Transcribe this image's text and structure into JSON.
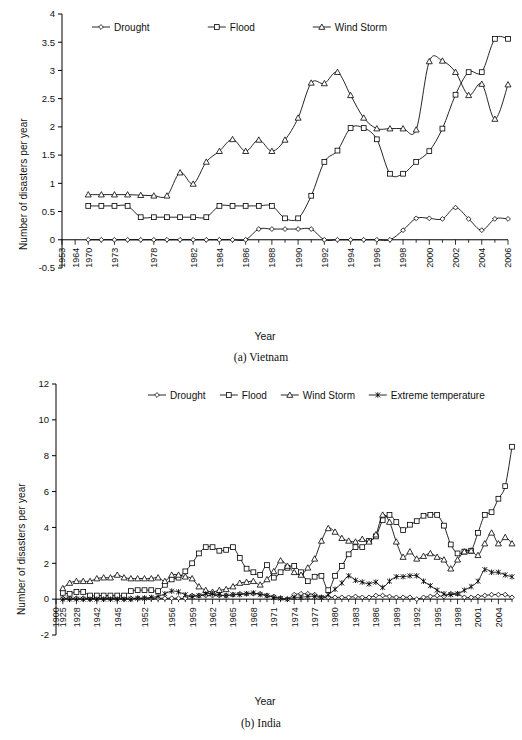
{
  "figure": {
    "panels": [
      {
        "caption": "(a) Vietnam",
        "xlabel": "Year",
        "ylabel": "Number of disasters per year"
      },
      {
        "caption": "(b) India",
        "xlabel": "Year",
        "ylabel": "Number of disasters per year"
      }
    ]
  },
  "chart_data": [
    {
      "type": "line",
      "title": "(a) Vietnam",
      "xlabel": "Year",
      "ylabel": "Number of disasters per year",
      "ylim": [
        -0.5,
        4
      ],
      "yticks": [
        -0.5,
        0,
        0.5,
        1,
        1.5,
        2,
        2.5,
        3,
        3.5,
        4
      ],
      "ytick_labels": [
        "-0.5",
        "0",
        "0.5",
        "1",
        "1.5",
        "2",
        "2.5",
        "3",
        "3.5",
        "4"
      ],
      "grid": false,
      "legend_position": "top-inside",
      "xtick_labels": [
        "1953",
        "1964",
        "1970",
        "1973",
        "1978",
        "1982",
        "1984",
        "1986",
        "1988",
        "1990",
        "1992",
        "1994",
        "1996",
        "1998",
        "2000",
        "2002",
        "2004",
        "2006"
      ],
      "xtick_indices": [
        0,
        1,
        2,
        4,
        7,
        10,
        12,
        14,
        16,
        18,
        20,
        22,
        24,
        26,
        28,
        30,
        32,
        34
      ],
      "x": [
        1953,
        1964,
        1970,
        1971,
        1972,
        1973,
        1976,
        1977,
        1978,
        1980,
        1982,
        1983,
        1984,
        1985,
        1986,
        1987,
        1988,
        1989,
        1990,
        1991,
        1992,
        1993,
        1994,
        1995,
        1996,
        1997,
        1998,
        1999,
        2000,
        2001,
        2002,
        2003,
        2004,
        2005,
        2006
      ],
      "series": [
        {
          "name": "Drought",
          "marker": "diamond",
          "values": [
            null,
            null,
            0,
            0,
            0,
            0,
            0,
            0,
            0,
            0,
            0,
            0,
            0,
            0,
            0,
            0.19,
            0.19,
            0.19,
            0.19,
            0.19,
            0,
            0,
            0,
            0,
            0,
            0,
            0.17,
            0.38,
            0.38,
            0.37,
            0.57,
            0.37,
            0.17,
            0.37,
            0.37
          ]
        },
        {
          "name": "Flood",
          "marker": "square",
          "values": [
            null,
            null,
            0.6,
            0.6,
            0.6,
            0.6,
            0.4,
            0.4,
            0.4,
            0.4,
            0.4,
            0.4,
            0.6,
            0.6,
            0.6,
            0.6,
            0.6,
            0.38,
            0.38,
            0.78,
            1.38,
            1.58,
            1.98,
            1.98,
            1.78,
            1.17,
            1.17,
            1.38,
            1.57,
            1.97,
            2.57,
            2.97,
            2.97,
            3.56,
            3.56
          ]
        },
        {
          "name": "Wind Storm",
          "marker": "triangle",
          "values": [
            null,
            null,
            0.8,
            0.8,
            0.8,
            0.8,
            0.79,
            0.78,
            0.78,
            1.19,
            0.99,
            1.38,
            1.57,
            1.78,
            1.57,
            1.77,
            1.57,
            1.77,
            2.16,
            2.78,
            2.77,
            2.97,
            2.56,
            2.16,
            1.97,
            1.97,
            1.97,
            1.95,
            3.16,
            3.17,
            2.97,
            2.56,
            2.76,
            2.14,
            2.75
          ]
        }
      ]
    },
    {
      "type": "line",
      "title": "(b) India",
      "xlabel": "Year",
      "ylabel": "Number of disasters per year",
      "ylim": [
        -2,
        12
      ],
      "yticks": [
        -2,
        0,
        2,
        4,
        6,
        8,
        10,
        12
      ],
      "ytick_labels": [
        "-2",
        "0",
        "2",
        "4",
        "6",
        "8",
        "10",
        "12"
      ],
      "grid": false,
      "legend_position": "top-inside",
      "xtick_labels": [
        "1900",
        "1925",
        "1928",
        "1942",
        "1945",
        "1952",
        "1956",
        "1959",
        "1962",
        "1965",
        "1968",
        "1971",
        "1974",
        "1977",
        "1980",
        "1983",
        "1986",
        "1989",
        "1992",
        "1995",
        "1998",
        "2001",
        "2004"
      ],
      "xtick_indices": [
        0,
        1,
        3,
        6,
        9,
        13,
        17,
        20,
        23,
        26,
        29,
        32,
        35,
        38,
        41,
        44,
        47,
        50,
        53,
        56,
        59,
        62,
        65
      ],
      "x": [
        1900,
        1925,
        1926,
        1928,
        1930,
        1935,
        1942,
        1943,
        1944,
        1945,
        1946,
        1950,
        1951,
        1952,
        1953,
        1954,
        1955,
        1956,
        1957,
        1958,
        1959,
        1960,
        1961,
        1962,
        1963,
        1964,
        1965,
        1966,
        1967,
        1968,
        1969,
        1970,
        1971,
        1972,
        1973,
        1974,
        1975,
        1976,
        1977,
        1978,
        1979,
        1980,
        1981,
        1982,
        1983,
        1984,
        1985,
        1986,
        1987,
        1988,
        1989,
        1990,
        1991,
        1992,
        1993,
        1994,
        1995,
        1996,
        1997,
        1998,
        1999,
        2000,
        2001,
        2002,
        2003,
        2004,
        2005,
        2006
      ],
      "series": [
        {
          "name": "Drought",
          "marker": "diamond",
          "values": [
            null,
            0.05,
            0.05,
            0.05,
            0.05,
            0.05,
            0.05,
            0.05,
            0.05,
            0.05,
            0.05,
            0.05,
            0.05,
            0.05,
            0.05,
            0.05,
            0.05,
            0.05,
            0.05,
            0.05,
            0.2,
            0.2,
            0.2,
            0.2,
            0.2,
            0.2,
            0.25,
            0.3,
            0.3,
            0.3,
            0.3,
            0.2,
            0.15,
            0.05,
            0.0,
            0.25,
            0.3,
            0.3,
            0.25,
            0.1,
            0.1,
            0.1,
            0.1,
            0.1,
            0.15,
            0.1,
            0.1,
            0.2,
            0.2,
            0.15,
            0.1,
            0.1,
            0.1,
            0.0,
            0.1,
            0.15,
            0.2,
            0.15,
            0.3,
            0.3,
            0.1,
            0.1,
            0.15,
            0.2,
            0.25,
            0.25,
            0.25,
            0.1
          ]
        },
        {
          "name": "Flood",
          "marker": "square",
          "values": [
            null,
            0.35,
            0.3,
            0.4,
            0.4,
            0.2,
            0.2,
            0.2,
            0.2,
            0.2,
            0.2,
            0.45,
            0.5,
            0.5,
            0.5,
            0.45,
            0.8,
            1.1,
            1.2,
            1.55,
            2.0,
            2.55,
            2.9,
            2.9,
            2.7,
            2.75,
            2.9,
            2.3,
            1.7,
            1.5,
            1.35,
            1.9,
            1.2,
            1.5,
            1.75,
            1.85,
            1.5,
            1.0,
            1.25,
            1.3,
            0.5,
            1.3,
            1.85,
            2.5,
            2.9,
            2.9,
            3.25,
            3.5,
            4.4,
            4.7,
            4.3,
            3.85,
            4.15,
            4.35,
            4.65,
            4.7,
            4.7,
            4.1,
            3.05,
            2.55,
            2.65,
            2.7,
            3.7,
            4.7,
            4.85,
            5.6,
            6.3,
            8.5
          ]
        },
        {
          "name": "Wind Storm",
          "marker": "triangle",
          "values": [
            null,
            0.6,
            0.9,
            1.0,
            1.0,
            1.0,
            1.15,
            1.2,
            1.2,
            1.35,
            1.2,
            1.15,
            1.15,
            1.15,
            1.15,
            1.2,
            1.0,
            1.35,
            1.35,
            1.25,
            1.15,
            0.7,
            0.5,
            0.4,
            0.5,
            0.55,
            0.7,
            0.9,
            0.95,
            1.0,
            0.8,
            1.1,
            1.55,
            2.15,
            1.85,
            1.5,
            1.35,
            1.75,
            2.25,
            3.25,
            3.95,
            3.75,
            3.4,
            3.25,
            3.2,
            3.35,
            3.2,
            3.6,
            4.7,
            4.3,
            3.2,
            2.35,
            2.65,
            2.25,
            2.4,
            2.55,
            2.35,
            2.2,
            1.7,
            2.2,
            2.65,
            2.7,
            2.45,
            3.1,
            3.7,
            3.1,
            3.45,
            3.1
          ]
        },
        {
          "name": "Extreme temperature",
          "marker": "star",
          "values": [
            null,
            0.0,
            0.0,
            0.0,
            0.0,
            0.0,
            0.0,
            0.0,
            0.0,
            0.0,
            0.0,
            0.0,
            0.05,
            0.05,
            0.1,
            0.15,
            0.3,
            0.45,
            0.4,
            0.25,
            0.15,
            0.2,
            0.3,
            0.3,
            0.25,
            0.2,
            0.25,
            0.25,
            0.3,
            0.35,
            0.25,
            0.2,
            0.1,
            0.05,
            0.0,
            0.1,
            0.1,
            0.15,
            0.15,
            0.1,
            0.25,
            0.55,
            0.9,
            1.3,
            1.05,
            0.95,
            0.85,
            0.95,
            0.65,
            1.0,
            1.25,
            1.25,
            1.3,
            1.3,
            1.0,
            0.75,
            0.5,
            0.3,
            0.25,
            0.3,
            0.5,
            0.7,
            1.0,
            1.65,
            1.5,
            1.5,
            1.35,
            1.25
          ]
        }
      ]
    }
  ]
}
